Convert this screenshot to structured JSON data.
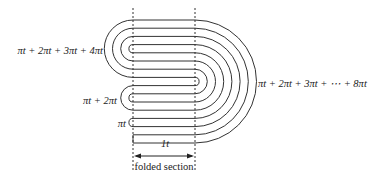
{
  "diagram": {
    "labels": {
      "left_group_1": "πt + 2πt + 3πt + 4πt",
      "left_group_2": "πt + 2πt",
      "left_group_3": "πt",
      "right_group": "πt + 2πt + 3πt + ⋯ + 8πt",
      "thickness": "1t",
      "section": "folded section"
    },
    "structure": {
      "horizontal_lines": 16,
      "right_semicircles": 8,
      "left_groups": [
        4,
        2,
        1
      ]
    },
    "colors": {
      "stroke": "#333333",
      "dashed": "#333333",
      "text": "#222222"
    }
  }
}
